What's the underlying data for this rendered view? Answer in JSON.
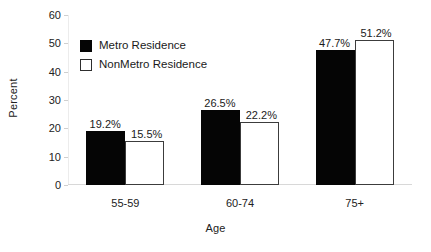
{
  "chart_data": {
    "type": "bar",
    "title": "",
    "xlabel": "Age",
    "ylabel": "Percent",
    "categories": [
      "55-59",
      "60-74",
      "75+"
    ],
    "series": [
      {
        "name": "Metro Residence",
        "values": [
          19.2,
          15.5,
          26.5
        ],
        "value_labels": [
          "19.2%",
          "26.5%",
          "47.7%"
        ],
        "color": "#050505",
        "fill": "solid"
      },
      {
        "name": "NonMetro Residence",
        "values": [
          15.5,
          22.2,
          51.2
        ],
        "value_labels": [
          "15.5%",
          "22.2%",
          "51.2%"
        ],
        "color": "#ffffff",
        "fill": "hollow"
      }
    ],
    "groups": [
      {
        "category": "55-59",
        "metro": 19.2,
        "nonmetro": 15.5,
        "metro_label": "19.2%",
        "nonmetro_label": "15.5%"
      },
      {
        "category": "60-74",
        "metro": 26.5,
        "nonmetro": 22.2,
        "metro_label": "26.5%",
        "nonmetro_label": "22.2%"
      },
      {
        "category": "75+",
        "metro": 47.7,
        "nonmetro": 51.2,
        "metro_label": "47.7%",
        "nonmetro_label": "51.2%"
      }
    ],
    "ylim": [
      0,
      60
    ],
    "yticks": [
      0,
      10,
      20,
      30,
      40,
      50,
      60
    ],
    "ytick_labels": [
      "0",
      "10",
      "20",
      "30",
      "40",
      "50",
      "60"
    ],
    "grid": false,
    "legend": {
      "position": "upper-left-inside",
      "entries": [
        {
          "label": "Metro Residence",
          "fill": "solid",
          "color": "#050505"
        },
        {
          "label": "NonMetro Residence",
          "fill": "hollow",
          "color": "#ffffff"
        }
      ]
    }
  }
}
